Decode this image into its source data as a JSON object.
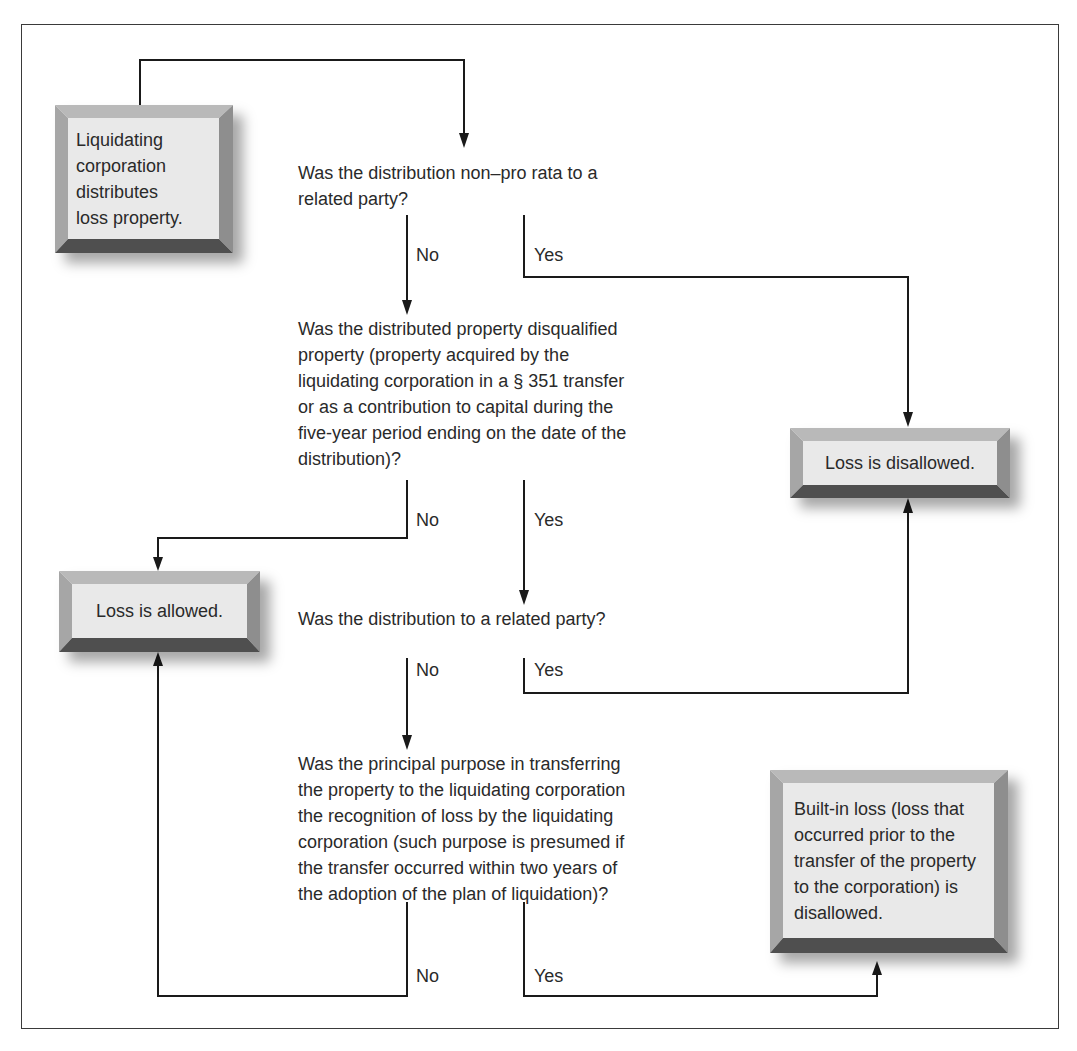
{
  "diagram": {
    "type": "flowchart",
    "start": {
      "text": "Liquidating\ncorporation\ndistributes\nloss property."
    },
    "questions": [
      {
        "id": "q1",
        "text": "Was the distribution non–pro rata to a\nrelated party?"
      },
      {
        "id": "q2",
        "text": "Was the distributed property disqualified\nproperty (property acquired by the\nliquidating corporation in a § 351 transfer\nor as a contribution to capital during the\nfive-year period ending on the date of the\ndistribution)?"
      },
      {
        "id": "q3",
        "text": "Was the distribution to a related party?"
      },
      {
        "id": "q4",
        "text": "Was the principal purpose in transferring\nthe property to the liquidating corporation\nthe recognition of loss by the liquidating\ncorporation (such purpose is presumed if\nthe transfer occurred within two years of\nthe adoption of the plan of liquidation)?"
      }
    ],
    "outcomes": {
      "disallowed": "Loss is disallowed.",
      "allowed": "Loss is allowed.",
      "built_in": "Built-in loss (loss that\noccurred prior to the\ntransfer of the property\nto the corporation) is\ndisallowed."
    },
    "branch_labels": {
      "q1_no": "No",
      "q1_yes": "Yes",
      "q2_no": "No",
      "q2_yes": "Yes",
      "q3_no": "No",
      "q3_yes": "Yes",
      "q4_no": "No",
      "q4_yes": "Yes"
    },
    "colors": {
      "face": "#e9e9e9",
      "bevel_top": "#b9b9b9",
      "bevel_left": "#a6a6a6",
      "bevel_right": "#8e8e8e",
      "bevel_bottom": "#4f4f4f",
      "line": "#1a1a1a"
    }
  }
}
